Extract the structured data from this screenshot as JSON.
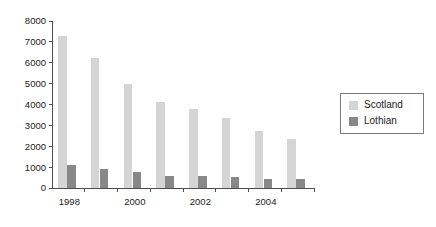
{
  "chart_data": {
    "type": "bar",
    "title": "",
    "subtitle": "",
    "xlabel": "",
    "ylabel": "",
    "categories": [
      "1998",
      "1999",
      "2000",
      "2001",
      "2002",
      "2003",
      "2004",
      "2005"
    ],
    "x_tick_labels_shown": [
      "1998",
      "",
      "2000",
      "",
      "2002",
      "",
      "2004",
      ""
    ],
    "series": [
      {
        "name": "Scotland",
        "color": "#d5d5d5",
        "values": [
          7300,
          6250,
          5000,
          4100,
          3800,
          3350,
          2750,
          2350
        ]
      },
      {
        "name": "Lothian",
        "color": "#888888",
        "values": [
          1100,
          930,
          780,
          560,
          580,
          550,
          420,
          430
        ]
      }
    ],
    "ylim": [
      0,
      8000
    ],
    "y_ticks": [
      0,
      1000,
      2000,
      3000,
      4000,
      5000,
      6000,
      7000,
      8000
    ],
    "y_tick_labels": [
      "0",
      "1000",
      "2000",
      "3000",
      "4000",
      "5000",
      "6000",
      "7000",
      "8000"
    ],
    "grid": false,
    "legend_position": "right",
    "legend_entries": [
      {
        "label": "Scotland",
        "swatch_color": "#d5d5d5"
      },
      {
        "label": "Lothian",
        "swatch_color": "#888888"
      }
    ],
    "axis_color": "#4d4d4d",
    "background_color": "#ffffff"
  }
}
